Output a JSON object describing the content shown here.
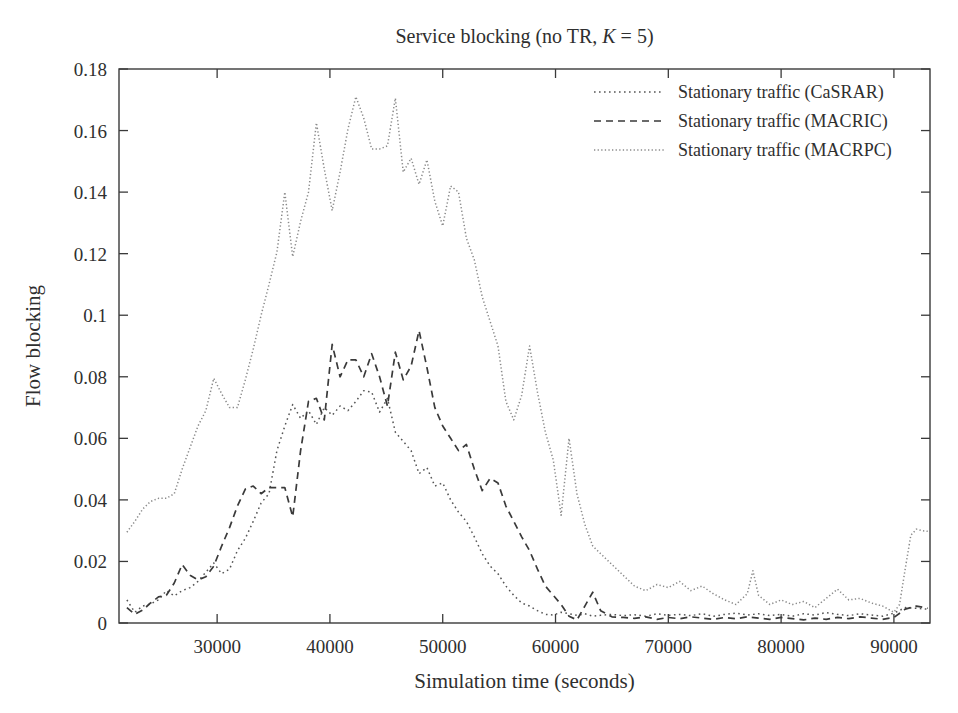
{
  "chart_data": {
    "type": "line",
    "title": "Service blocking (no TR, K = 5)",
    "title_parts": {
      "before": "Service blocking (no TR, ",
      "italic": "K",
      "after": " = 5)"
    },
    "xlabel": "Simulation time (seconds)",
    "ylabel": "Flow blocking",
    "xlim": [
      21300,
      93200
    ],
    "ylim": [
      0,
      0.18
    ],
    "xticks": [
      30000,
      40000,
      50000,
      60000,
      70000,
      80000,
      90000
    ],
    "xticklabels": [
      "30000",
      "40000",
      "50000",
      "60000",
      "70000",
      "80000",
      "90000"
    ],
    "yticks": [
      0,
      0.02,
      0.04,
      0.06,
      0.08,
      0.1,
      0.12,
      0.14,
      0.16,
      0.18
    ],
    "yticklabels": [
      "0",
      "0.02",
      "0.04",
      "0.06",
      "0.08",
      "0.1",
      "0.12",
      "0.14",
      "0.16",
      "0.18"
    ],
    "grid": false,
    "legend_position": "top-right",
    "frame_color": "#3a3a3a",
    "series": [
      {
        "name": "Stationary traffic (CaSRAR)",
        "dash": "dotted",
        "color": "#555555",
        "dasharray": "1.6 3.4",
        "width": 1.5,
        "x": [
          22000,
          22700,
          23400,
          24100,
          24800,
          25500,
          26200,
          26900,
          27600,
          28300,
          29000,
          29700,
          30400,
          31100,
          31800,
          32500,
          33200,
          33900,
          34600,
          35300,
          36000,
          36700,
          37400,
          38100,
          38800,
          39500,
          40200,
          40900,
          41600,
          42300,
          43000,
          43700,
          44400,
          45100,
          45800,
          46500,
          47200,
          47900,
          48600,
          49300,
          50000,
          50700,
          51400,
          52100,
          52800,
          53500,
          54200,
          54900,
          55600,
          56300,
          57000,
          57700,
          58400,
          59100,
          59800,
          60500,
          61200,
          61900,
          62600,
          63300,
          64000,
          65000,
          66000,
          67000,
          68000,
          69000,
          70000,
          71000,
          72000,
          73000,
          74000,
          75000,
          76000,
          77000,
          78000,
          79000,
          80000,
          81000,
          82000,
          83000,
          84000,
          85000,
          86000,
          87000,
          88000,
          89000,
          90000,
          91000,
          92000,
          93000
        ],
        "y": [
          0.0075,
          0.0035,
          0.0055,
          0.0062,
          0.0075,
          0.0105,
          0.0088,
          0.0105,
          0.0115,
          0.0135,
          0.0165,
          0.0195,
          0.016,
          0.0175,
          0.0235,
          0.0275,
          0.033,
          0.039,
          0.042,
          0.056,
          0.064,
          0.071,
          0.0665,
          0.069,
          0.0645,
          0.07,
          0.0675,
          0.0705,
          0.069,
          0.072,
          0.0755,
          0.075,
          0.0685,
          0.073,
          0.062,
          0.059,
          0.056,
          0.0485,
          0.0505,
          0.0445,
          0.0455,
          0.04,
          0.036,
          0.033,
          0.028,
          0.0225,
          0.0185,
          0.016,
          0.012,
          0.009,
          0.0065,
          0.0055,
          0.004,
          0.0028,
          0.0026,
          0.0035,
          0.003,
          0.0025,
          0.003,
          0.0022,
          0.0025,
          0.0028,
          0.0024,
          0.0027,
          0.0022,
          0.003,
          0.0025,
          0.0028,
          0.0024,
          0.003,
          0.0022,
          0.0028,
          0.0032,
          0.0026,
          0.003,
          0.0024,
          0.0028,
          0.0022,
          0.003,
          0.0026,
          0.0034,
          0.0028,
          0.0024,
          0.003,
          0.0026,
          0.0022,
          0.0032,
          0.005,
          0.0048,
          0.0045
        ]
      },
      {
        "name": "Stationary traffic (MACRIC)",
        "dash": "dashed",
        "color": "#3a3a3a",
        "dasharray": "7 5",
        "width": 1.7,
        "x": [
          22000,
          22700,
          23400,
          24100,
          24800,
          25500,
          26200,
          26900,
          27600,
          28300,
          29000,
          29700,
          30400,
          31100,
          31800,
          32500,
          33200,
          33900,
          34600,
          35300,
          36000,
          36700,
          37400,
          38100,
          38800,
          39500,
          40200,
          40900,
          41600,
          42300,
          43000,
          43700,
          44400,
          45100,
          45800,
          46500,
          47200,
          47900,
          48600,
          49300,
          50000,
          50700,
          51400,
          52100,
          52800,
          53500,
          54200,
          54900,
          55600,
          56300,
          57000,
          57700,
          58400,
          59100,
          59800,
          60500,
          61200,
          61900,
          62600,
          63300,
          64000,
          65000,
          66000,
          67000,
          68000,
          69000,
          70000,
          71000,
          72000,
          73000,
          74000,
          75000,
          76000,
          77000,
          78000,
          79000,
          80000,
          81000,
          82000,
          83000,
          84000,
          85000,
          86000,
          87000,
          88000,
          89000,
          90000,
          91000,
          92000,
          93000
        ],
        "y": [
          0.005,
          0.0028,
          0.0042,
          0.0065,
          0.0085,
          0.009,
          0.013,
          0.019,
          0.0155,
          0.014,
          0.015,
          0.0185,
          0.025,
          0.031,
          0.038,
          0.0435,
          0.0445,
          0.042,
          0.044,
          0.044,
          0.044,
          0.0345,
          0.056,
          0.072,
          0.073,
          0.066,
          0.0905,
          0.08,
          0.0855,
          0.0855,
          0.08,
          0.0875,
          0.08,
          0.0705,
          0.088,
          0.079,
          0.0835,
          0.095,
          0.083,
          0.07,
          0.064,
          0.06,
          0.056,
          0.058,
          0.05,
          0.043,
          0.047,
          0.0455,
          0.038,
          0.033,
          0.028,
          0.0235,
          0.0175,
          0.012,
          0.009,
          0.006,
          0.0022,
          0.001,
          0.0055,
          0.01,
          0.004,
          0.002,
          0.0018,
          0.0015,
          0.002,
          0.0012,
          0.0018,
          0.0014,
          0.002,
          0.0016,
          0.0012,
          0.0018,
          0.0014,
          0.002,
          0.0016,
          0.0012,
          0.0018,
          0.0014,
          0.001,
          0.0016,
          0.0012,
          0.0018,
          0.0014,
          0.002,
          0.0016,
          0.0012,
          0.0018,
          0.0045,
          0.0055,
          0.0048
        ]
      },
      {
        "name": "Stationary traffic (MACRPC)",
        "dash": "fine-dotted",
        "color": "#8a8a8a",
        "dasharray": "1.3 2.3",
        "width": 1.5,
        "x": [
          22000,
          22700,
          23400,
          24100,
          24800,
          25500,
          26200,
          26900,
          27600,
          28300,
          29000,
          29700,
          30400,
          31100,
          31800,
          32500,
          33200,
          33900,
          34600,
          35300,
          36000,
          36700,
          37400,
          38100,
          38800,
          39500,
          40200,
          40900,
          41600,
          42300,
          43000,
          43700,
          44400,
          45100,
          45800,
          46500,
          47200,
          47900,
          48600,
          49300,
          50000,
          50700,
          51400,
          52100,
          52800,
          53500,
          54200,
          54900,
          55600,
          56300,
          57000,
          57700,
          58400,
          59100,
          59800,
          60500,
          61200,
          61900,
          62600,
          63300,
          64000,
          65000,
          66000,
          67000,
          68000,
          69000,
          70000,
          71000,
          72000,
          73000,
          74000,
          75000,
          76000,
          77000,
          77500,
          78000,
          79000,
          80000,
          81000,
          82000,
          83000,
          84000,
          85000,
          86000,
          87000,
          88000,
          89000,
          90000,
          90500,
          91000,
          91500,
          92000,
          92500,
          93000
        ],
        "y": [
          0.0295,
          0.033,
          0.037,
          0.0395,
          0.0405,
          0.0405,
          0.042,
          0.05,
          0.057,
          0.064,
          0.069,
          0.0795,
          0.0745,
          0.07,
          0.07,
          0.079,
          0.089,
          0.1,
          0.11,
          0.1205,
          0.14,
          0.119,
          0.1305,
          0.14,
          0.1625,
          0.1475,
          0.134,
          0.1465,
          0.1605,
          0.171,
          0.164,
          0.154,
          0.154,
          0.155,
          0.1705,
          0.1465,
          0.151,
          0.1425,
          0.1505,
          0.137,
          0.129,
          0.142,
          0.14,
          0.125,
          0.118,
          0.106,
          0.098,
          0.09,
          0.072,
          0.066,
          0.074,
          0.09,
          0.075,
          0.062,
          0.053,
          0.035,
          0.06,
          0.042,
          0.032,
          0.025,
          0.0225,
          0.019,
          0.0155,
          0.012,
          0.0105,
          0.0125,
          0.0115,
          0.0135,
          0.0105,
          0.012,
          0.0095,
          0.0075,
          0.006,
          0.0095,
          0.017,
          0.009,
          0.006,
          0.0075,
          0.006,
          0.007,
          0.005,
          0.008,
          0.011,
          0.0075,
          0.008,
          0.0065,
          0.0055,
          0.0035,
          0.006,
          0.0175,
          0.0285,
          0.0305,
          0.03,
          0.0298
        ]
      }
    ]
  }
}
